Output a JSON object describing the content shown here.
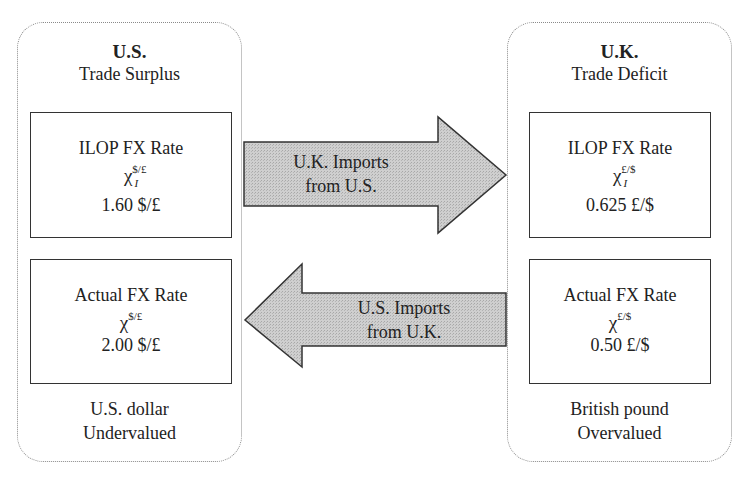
{
  "left_panel": {
    "country": "U.S.",
    "status": "Trade Surplus",
    "ilop_box": {
      "title": "ILOP FX Rate",
      "symbol": "χ",
      "symbol_sup": "$/£",
      "symbol_sub": "I",
      "value": "1.60 $/£"
    },
    "actual_box": {
      "title": "Actual FX Rate",
      "symbol": "χ",
      "symbol_sup": "$/£",
      "value": "2.00 $/£"
    },
    "footer_line1": "U.S. dollar",
    "footer_line2": "Undervalued"
  },
  "right_panel": {
    "country": "U.K.",
    "status": "Trade Deficit",
    "ilop_box": {
      "title": "ILOP FX Rate",
      "symbol": "χ",
      "symbol_sup": "£/$",
      "symbol_sub": "I",
      "value": "0.625 £/$"
    },
    "actual_box": {
      "title": "Actual FX Rate",
      "symbol": "χ",
      "symbol_sup": "£/$",
      "value": "0.50 £/$"
    },
    "footer_line1": "British pound",
    "footer_line2": "Overvalued"
  },
  "arrows": {
    "top": {
      "direction": "right",
      "line1": "U.K. Imports",
      "line2": "from U.S."
    },
    "bottom": {
      "direction": "left",
      "line1": "U.S. Imports",
      "line2": "from U.K."
    }
  },
  "colors": {
    "arrow_fill": "#c8c8c8",
    "arrow_stroke": "#333333",
    "panel_border": "#8a8a8a",
    "box_border": "#333333"
  }
}
